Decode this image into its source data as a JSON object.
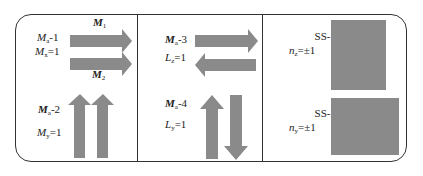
{
  "panels": [
    {
      "id": "panel-1",
      "labels": {
        "mode_upper": {
          "symbol": "M",
          "sub": "a",
          "suffix": "-1"
        },
        "component_upper": {
          "symbol": "M",
          "sub": "x",
          "suffix": "=1"
        },
        "arrow_top": {
          "symbol": "M",
          "sub": "1"
        },
        "arrow_bottom": {
          "symbol": "M",
          "sub": "2"
        },
        "mode_lower": {
          "symbol": "M",
          "sub": "a",
          "suffix": "-2"
        },
        "component_lower": {
          "symbol": "M",
          "sub": "y",
          "suffix": "=1"
        }
      },
      "arrows": [
        "right",
        "right",
        "up",
        "up"
      ]
    },
    {
      "id": "panel-2",
      "labels": {
        "mode_upper": {
          "symbol": "M",
          "sub": "a",
          "suffix": "-3"
        },
        "component_upper": {
          "symbol": "L",
          "sub": "z",
          "suffix": "=1"
        },
        "mode_lower": {
          "symbol": "M",
          "sub": "a",
          "suffix": "-4"
        },
        "component_lower": {
          "symbol": "L",
          "sub": "y",
          "suffix": "=1"
        }
      },
      "arrows": [
        "right",
        "left",
        "up",
        "down"
      ]
    },
    {
      "id": "panel-3",
      "labels": {
        "ss1_name": "SS-1",
        "ss1_value": {
          "symbol": "n",
          "sub": "z",
          "suffix": "=±1"
        },
        "ss2_name": "SS-2",
        "ss2_value": {
          "symbol": "n",
          "sub": "y",
          "suffix": "=±1"
        }
      }
    }
  ],
  "colors": {
    "arrow_fill": "#8a8a8a",
    "border": "#333333"
  }
}
